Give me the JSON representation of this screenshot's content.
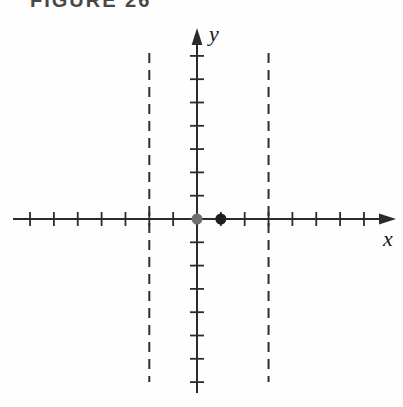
{
  "figure": {
    "title": "FIGURE 26",
    "background": "#fefefe"
  },
  "chart_data": {
    "type": "scatter",
    "title": "FIGURE 26",
    "xlabel": "x",
    "ylabel": "y",
    "x_range": [
      -7,
      7
    ],
    "y_range": [
      -7,
      7
    ],
    "tick_step": 1,
    "grid": false,
    "legend": false,
    "axis_color": "#2b2b2b",
    "dash_color": "#2e2e2e",
    "points": [
      {
        "x": 0,
        "y": 0,
        "color": "#6f6f6f",
        "style": "filled-circle",
        "name": "gray-point-origin"
      },
      {
        "x": 1,
        "y": 0,
        "color": "#1e1e1e",
        "style": "filled-circle",
        "name": "black-point-x1"
      }
    ],
    "vertical_dashed_lines": [
      {
        "x": -2
      },
      {
        "x": 3
      }
    ]
  }
}
